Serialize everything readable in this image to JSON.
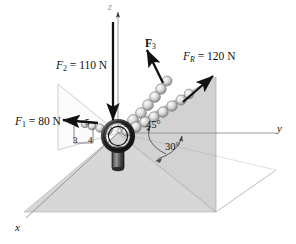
{
  "figure": {
    "type": "free-body-diagram",
    "background_color": "#ffffff",
    "ink_color": "#111111"
  },
  "axes": {
    "x_label": "x",
    "y_label": "y",
    "z_label": "z"
  },
  "forces": {
    "f1": {
      "name_prefix": "F",
      "subscript": "1",
      "equals": " = ",
      "magnitude": "80 N",
      "full_label": "F1 = 80 N",
      "direction": "negative x-y plane, toward left",
      "slope_triangle": {
        "vertical": "3",
        "horizontal": "4",
        "hypotenuse": "5"
      }
    },
    "f2": {
      "name_prefix": "F",
      "subscript": "2",
      "equals": " = ",
      "magnitude": "110 N",
      "full_label": "F2 = 110 N",
      "direction": "downward along negative z"
    },
    "f3": {
      "name_prefix": "F",
      "subscript": "3",
      "equals": "",
      "magnitude": "",
      "full_label": "F3",
      "direction": "upward to the right, unknown magnitude",
      "bold_vector": true
    },
    "fr": {
      "name_prefix": "F",
      "subscript": "R",
      "equals": " = ",
      "magnitude": "120 N",
      "full_label": "FR = 120 N",
      "direction": "resultant, upward right in vertical plane"
    }
  },
  "angles": {
    "upper": "45°",
    "lower": "30°"
  },
  "colors": {
    "ground_plane": "#d7d7d7",
    "vertical_plane": "#d2d2d2",
    "left_plane": "#ffffff",
    "outline": "#9a9a9a",
    "arrow": "#111111",
    "chain_light": "#e8e8e8",
    "chain_dark": "#8d8d8d"
  }
}
